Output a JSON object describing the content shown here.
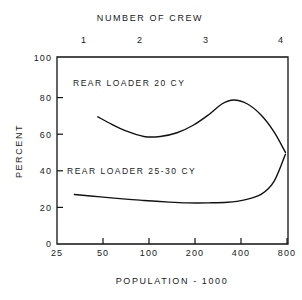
{
  "chart_data": {
    "type": "line",
    "title": "",
    "xlabel": "POPULATION - 1000",
    "ylabel": "PERCENT",
    "top_axis_label": "NUMBER OF CREW",
    "xscale": "log",
    "xlim": [
      25,
      1000
    ],
    "ylim": [
      0,
      100
    ],
    "grid": false,
    "legend": "inline-annotations",
    "xticks": [
      25,
      50,
      100,
      200,
      400,
      800
    ],
    "xtick_labels": [
      "25",
      "50",
      "100",
      "200",
      "400",
      "800"
    ],
    "yticks": [
      0,
      20,
      40,
      60,
      80,
      100
    ],
    "ytick_labels": [
      "0",
      "20",
      "40",
      "60",
      "80",
      "100"
    ],
    "top_xticks": [
      1,
      2,
      3,
      4
    ],
    "top_xtick_labels": [
      "1",
      "2",
      "3",
      "4"
    ],
    "series": [
      {
        "name": "REAR LOADER 20 CY",
        "x": [
          48,
          60,
          75,
          100,
          130,
          170,
          220,
          280,
          350,
          420,
          520,
          650,
          800,
          960
        ],
        "values": [
          68,
          64,
          60.5,
          57.5,
          57.5,
          59.5,
          63.5,
          69,
          75,
          77,
          75,
          69,
          60,
          49
        ]
      },
      {
        "name": "REAR LOADER 25-30 CY",
        "x": [
          33,
          50,
          75,
          100,
          150,
          200,
          280,
          380,
          500,
          650,
          800,
          960
        ],
        "values": [
          26.5,
          25.2,
          24.0,
          23.3,
          22.4,
          22.0,
          22.0,
          22.3,
          23.6,
          26.5,
          33.5,
          48
        ]
      }
    ],
    "annotations": [
      {
        "text": "REAR LOADER 20 CY",
        "x_px": 73,
        "y_px": 82
      },
      {
        "text": "REAR LOADER 25-30 CY",
        "x_px": 67,
        "y_px": 171
      }
    ]
  },
  "axes": {
    "y_title": "PERCENT",
    "x_title": "POPULATION - 1000",
    "top_title": "NUMBER OF CREW"
  }
}
